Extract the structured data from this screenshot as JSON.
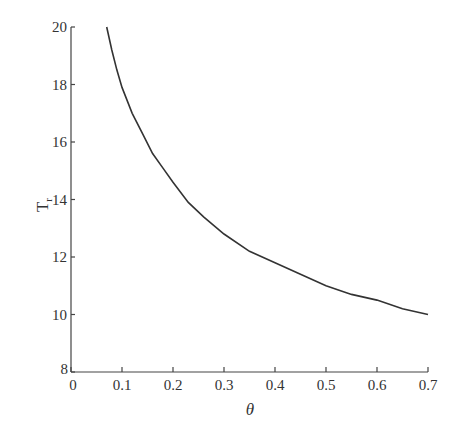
{
  "chart_data": {
    "type": "line",
    "title": "",
    "xlabel": "θ",
    "ylabel": "T",
    "ylabel_subscript": "r",
    "xlim": [
      0,
      0.7
    ],
    "ylim": [
      8,
      20
    ],
    "xticks": [
      0,
      0.1,
      0.2,
      0.3,
      0.4,
      0.5,
      0.6,
      0.7
    ],
    "xtick_labels": [
      "0",
      "0.1",
      "0.2",
      "0.3",
      "0.4",
      "0.5",
      "0.6",
      "0.7"
    ],
    "yticks": [
      8,
      10,
      12,
      14,
      16,
      18,
      20
    ],
    "ytick_labels": [
      "8",
      "10",
      "12",
      "14",
      "16",
      "18",
      "20"
    ],
    "grid": false,
    "legend": null,
    "series": [
      {
        "name": "Tr",
        "color": "#333333",
        "x": [
          0.07,
          0.08,
          0.09,
          0.1,
          0.12,
          0.14,
          0.16,
          0.18,
          0.2,
          0.23,
          0.26,
          0.3,
          0.35,
          0.4,
          0.45,
          0.5,
          0.55,
          0.6,
          0.65,
          0.7
        ],
        "values": [
          20.0,
          19.2,
          18.5,
          17.9,
          17.0,
          16.3,
          15.6,
          15.1,
          14.6,
          13.9,
          13.4,
          12.8,
          12.2,
          11.8,
          11.4,
          11.0,
          10.7,
          10.5,
          10.2,
          10.0
        ]
      }
    ]
  }
}
